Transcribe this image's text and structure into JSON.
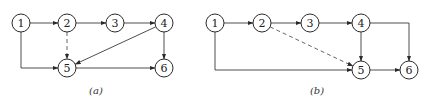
{
  "figure": {
    "panels": [
      {
        "id": "a",
        "caption": "(a)",
        "caption_pos": [
          96,
          94
        ],
        "nodes": [
          {
            "label": "1",
            "x": 21,
            "y": 23
          },
          {
            "label": "2",
            "x": 67,
            "y": 23
          },
          {
            "label": "3",
            "x": 115,
            "y": 23
          },
          {
            "label": "4",
            "x": 164,
            "y": 23
          },
          {
            "label": "5",
            "x": 67,
            "y": 68
          },
          {
            "label": "6",
            "x": 164,
            "y": 68
          }
        ],
        "edges": [
          {
            "from": "1",
            "to": "2",
            "style": "solid",
            "route": "straight"
          },
          {
            "from": "2",
            "to": "3",
            "style": "solid",
            "route": "straight"
          },
          {
            "from": "3",
            "to": "4",
            "style": "solid",
            "route": "straight"
          },
          {
            "from": "2",
            "to": "5",
            "style": "dashed",
            "route": "straight"
          },
          {
            "from": "4",
            "to": "5",
            "style": "solid",
            "route": "straight"
          },
          {
            "from": "4",
            "to": "6",
            "style": "solid",
            "route": "straight"
          },
          {
            "from": "1",
            "to": "5",
            "style": "solid",
            "route": "elbow-down-right"
          },
          {
            "from": "5",
            "to": "6",
            "style": "solid",
            "route": "straight"
          }
        ]
      },
      {
        "id": "b",
        "caption": "(b)",
        "caption_pos": [
          317,
          94
        ],
        "nodes": [
          {
            "label": "1",
            "x": 215,
            "y": 23
          },
          {
            "label": "2",
            "x": 262,
            "y": 23
          },
          {
            "label": "3",
            "x": 310,
            "y": 23
          },
          {
            "label": "4",
            "x": 361,
            "y": 23
          },
          {
            "label": "5",
            "x": 361,
            "y": 70
          },
          {
            "label": "6",
            "x": 409,
            "y": 70
          }
        ],
        "edges": [
          {
            "from": "1",
            "to": "2",
            "style": "solid",
            "route": "straight"
          },
          {
            "from": "2",
            "to": "3",
            "style": "solid",
            "route": "straight"
          },
          {
            "from": "3",
            "to": "4",
            "style": "solid",
            "route": "straight"
          },
          {
            "from": "2",
            "to": "5",
            "style": "dashed",
            "route": "straight"
          },
          {
            "from": "4",
            "to": "5",
            "style": "solid",
            "route": "straight"
          },
          {
            "from": "4",
            "to": "6",
            "style": "solid",
            "route": "elbow-right-down"
          },
          {
            "from": "1",
            "to": "5",
            "style": "solid",
            "route": "elbow-down-right"
          },
          {
            "from": "5",
            "to": "6",
            "style": "solid",
            "route": "straight"
          }
        ]
      }
    ],
    "node_radius": 9,
    "colors": {
      "stroke": "#2a2a2a",
      "text": "#222222",
      "background": "#ffffff"
    }
  }
}
